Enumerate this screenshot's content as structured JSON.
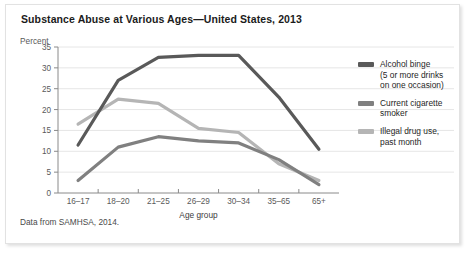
{
  "figure": {
    "title": "Substance Abuse at Various Ages—United States, 2013",
    "footnote": "Data from SAMHSA, 2014.",
    "y_axis_caption": "Percent"
  },
  "legend": {
    "position": "right",
    "entries": [
      {
        "name": "Alcohol binge",
        "label_lines": [
          "Alcohol binge",
          "(5 or more drinks",
          "on one occasion)"
        ],
        "color": "#595959"
      },
      {
        "name": "Current cigarette smoker",
        "label_lines": [
          "Current cigarette",
          "smoker"
        ],
        "color": "#808080"
      },
      {
        "name": "Illegal drug use, past month",
        "label_lines": [
          "Illegal drug use,",
          "past month"
        ],
        "color": "#b5b5b5"
      }
    ]
  },
  "chart_data": {
    "type": "line",
    "title": "Substance Abuse at Various Ages—United States, 2013",
    "xlabel": "Age group",
    "ylabel": "Percent",
    "categories": [
      "16–17",
      "18–20",
      "21–25",
      "26–29",
      "30–34",
      "35–65",
      "65+"
    ],
    "ylim": [
      0,
      35
    ],
    "yticks": [
      0,
      5,
      10,
      15,
      20,
      25,
      30,
      35
    ],
    "ytick_labels": [
      "0",
      "5",
      "10",
      "15",
      "20",
      "25",
      "30",
      "35"
    ],
    "grid": "horizontal",
    "series": [
      {
        "name": "Alcohol binge (5 or more drinks on one occasion)",
        "color": "#595959",
        "values": [
          11.5,
          27.0,
          32.5,
          33.0,
          33.0,
          23.0,
          10.5
        ]
      },
      {
        "name": "Current cigarette smoker",
        "color": "#808080",
        "values": [
          3.0,
          11.0,
          13.5,
          12.5,
          12.0,
          8.0,
          2.0
        ]
      },
      {
        "name": "Illegal drug use, past month",
        "color": "#b5b5b5",
        "values": [
          16.5,
          22.5,
          21.5,
          15.5,
          14.5,
          7.0,
          3.0
        ]
      }
    ]
  }
}
